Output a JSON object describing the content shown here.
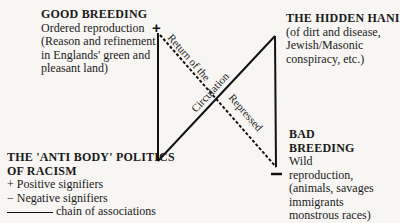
{
  "good_breeding": {
    "title": "GOOD BREEDING",
    "lines": [
      "Ordered reproduction",
      "(Reason and refinement",
      "in Englands' green and",
      "pleasant land)"
    ]
  },
  "hidden_hand": {
    "title": "THE HIDDEN HANI",
    "lines": [
      "(of dirt and disease,",
      "Jewish/Masonic",
      "conspiracy, etc.)"
    ]
  },
  "bad_breeding": {
    "title_line1": "BAD",
    "title_line2": "BREEDING",
    "lines": [
      "Wild",
      "reproduction,",
      "(animals, savages",
      "immigrants",
      "monstrous races)"
    ]
  },
  "legend": {
    "title_line1": "THE 'ANTI BODY' POLITICS",
    "title_line2": "OF RACISM",
    "positive": "+ Positive signifiers",
    "negative": "− Negative signifiers",
    "chain": "chain of associations"
  },
  "diagram": {
    "plus_sign": "+",
    "minus_sign": "—",
    "label_return": "Return of the",
    "label_circulation": "Circulation",
    "label_repressed": "Repressed"
  }
}
